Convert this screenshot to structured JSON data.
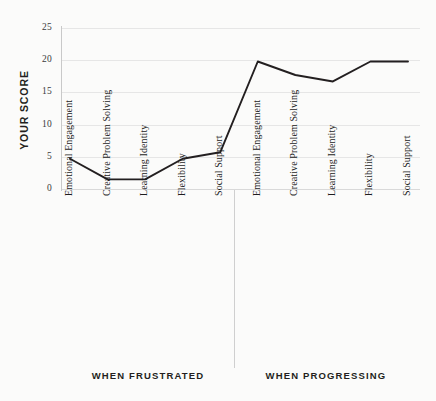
{
  "chart_data": {
    "type": "line",
    "title": "",
    "xlabel": "",
    "ylabel": "YOUR SCORE",
    "ylim": [
      0,
      25
    ],
    "yticks": [
      0,
      5,
      10,
      15,
      20,
      25
    ],
    "grid": true,
    "legend": null,
    "categories": [
      "Emotional Engagement",
      "Creative Problem Solving",
      "Learning Identity",
      "Flexibility",
      "Social Support",
      "Emotional Engagement",
      "Creative Problem Solving",
      "Learning Identity",
      "Flexibility",
      "Social Support"
    ],
    "values": [
      4.7,
      1.5,
      1.5,
      4.7,
      5.7,
      19.8,
      17.7,
      16.7,
      19.8,
      19.8
    ],
    "groups": [
      {
        "label": "WHEN FRUSTRATED",
        "categories": [
          "Emotional Engagement",
          "Creative Problem Solving",
          "Learning Identity",
          "Flexibility",
          "Social Support"
        ],
        "values": [
          4.7,
          1.5,
          1.5,
          4.7,
          5.7
        ]
      },
      {
        "label": "WHEN PROGRESSING",
        "categories": [
          "Emotional Engagement",
          "Creative Problem Solving",
          "Learning Identity",
          "Flexibility",
          "Social Support"
        ],
        "values": [
          19.8,
          17.7,
          16.7,
          19.8,
          19.8
        ]
      }
    ],
    "colors": {
      "line": "#231f20",
      "grid": "#e6e6e6",
      "axis": "#c9c9c9",
      "background": "#fbfbfa",
      "text": "#231f20"
    }
  },
  "axis": {
    "y_title": "YOUR SCORE",
    "y_tick_labels": [
      "25",
      "20",
      "15",
      "10",
      "5",
      "0"
    ]
  },
  "groups": {
    "frustrated_label": "WHEN FRUSTRATED",
    "progressing_label": "WHEN PROGRESSING"
  },
  "categories": {
    "g0c0": "Emotional Engagement",
    "g0c1": "Creative Problem Solving",
    "g0c2": "Learning Identity",
    "g0c3": "Flexibility",
    "g0c4": "Social Support",
    "g1c0": "Emotional Engagement",
    "g1c1": "Creative Problem Solving",
    "g1c2": "Learning Identity",
    "g1c3": "Flexibility",
    "g1c4": "Social Support"
  }
}
